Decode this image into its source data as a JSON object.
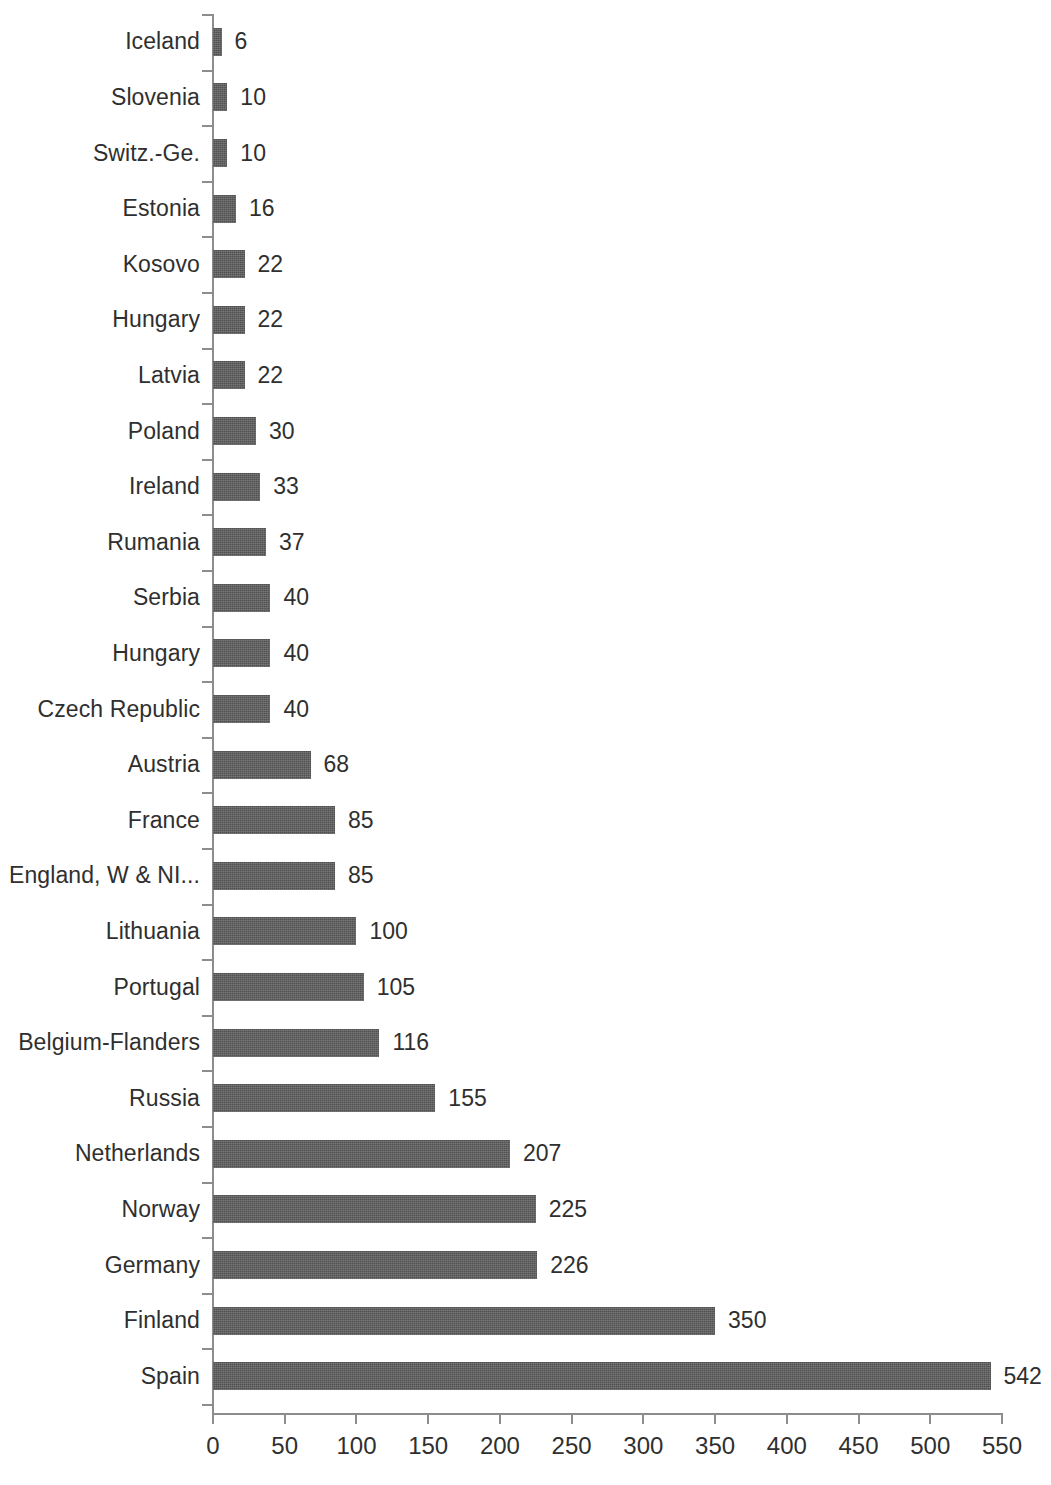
{
  "chart_data": {
    "type": "bar",
    "orientation": "horizontal",
    "title": "",
    "subtitle": "",
    "xlabel": "",
    "ylabel": "",
    "xlim": [
      0,
      550
    ],
    "x_tick_labels": [
      "0",
      "50",
      "100",
      "150",
      "200",
      "250",
      "300",
      "350",
      "400",
      "450",
      "500",
      "550"
    ],
    "x_ticks": [
      0,
      50,
      100,
      150,
      200,
      250,
      300,
      350,
      400,
      450,
      500,
      550
    ],
    "grid": false,
    "legend": false,
    "legend_position": "none",
    "data_labels": true,
    "bar_color": "#5b5b5b",
    "axis_color": "#8d8d8d",
    "text_color": "#2f2f2f",
    "background": "#ffffff",
    "categories": [
      "Iceland",
      "Slovenia",
      "Switz.-Ge.",
      "Estonia",
      "Kosovo",
      "Hungary",
      "Latvia",
      "Poland",
      "Ireland",
      "Rumania",
      "Serbia",
      "Hungary",
      "Czech Republic",
      "Austria",
      "France",
      "England, W & NI...",
      "Lithuania",
      "Portugal",
      "Belgium-Flanders",
      "Russia",
      "Netherlands",
      "Norway",
      "Germany",
      "Finland",
      "Spain"
    ],
    "values": [
      6,
      10,
      10,
      16,
      22,
      22,
      22,
      30,
      33,
      37,
      40,
      40,
      40,
      68,
      85,
      85,
      100,
      105,
      116,
      155,
      207,
      225,
      226,
      350,
      542
    ],
    "value_labels": [
      "6",
      "10",
      "10",
      "16",
      "22",
      "22",
      "22",
      "30",
      "33",
      "37",
      "40",
      "40",
      "40",
      "68",
      "85",
      "85",
      "100",
      "105",
      "116",
      "155",
      "207",
      "225",
      "226",
      "350",
      "542"
    ]
  }
}
